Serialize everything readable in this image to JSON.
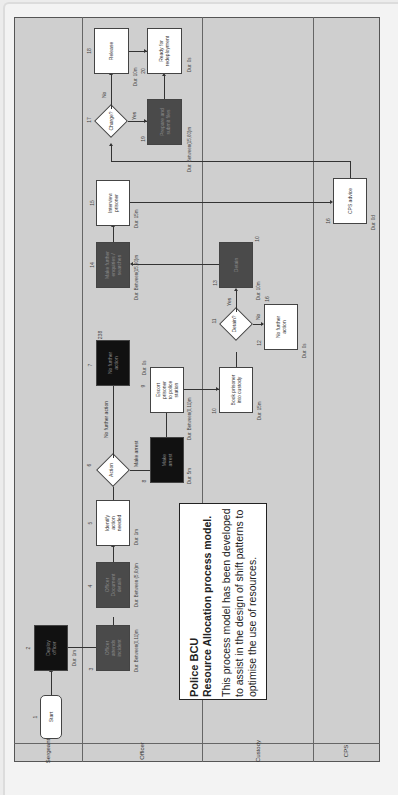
{
  "info_box": {
    "title": "Police BCU",
    "subtitle": "Resource Allocation process model.",
    "body": "This process model has been developed to assist in the design of shift patterns to optimise the use of resources."
  },
  "lanes": [
    {
      "name": "Sergeant"
    },
    {
      "name": "Officer"
    },
    {
      "name": "Custody"
    },
    {
      "name": "CPS"
    }
  ],
  "nodes": {
    "n1": {
      "id": "1",
      "label": "Start",
      "type": "start"
    },
    "n2": {
      "id": "2",
      "label": "Deploy\nofficer",
      "type": "task-black",
      "badge": "3",
      "duration": "Dur: 1m"
    },
    "n3": {
      "id": "3",
      "label": "Officer\nattends\nincident",
      "type": "task-dark",
      "badge": "35",
      "duration": "Dur: Between(0,11)m"
    },
    "n4": {
      "id": "4",
      "label": "Officer\nDocument\ndetails",
      "type": "task-dark",
      "badge": "100%",
      "duration": "Dur: Between\n(5,6x)m"
    },
    "n5": {
      "id": "5",
      "label": "Identify\naction\nneeded",
      "type": "task-white",
      "duration": "Dur: 1m"
    },
    "n6": {
      "id": "6",
      "label": "Action",
      "type": "decision"
    },
    "n7": {
      "id": "7",
      "label": "No further\naction",
      "type": "task-black",
      "badge": "238",
      "duration": "Dur: 0s"
    },
    "n8": {
      "id": "8",
      "label": "Make\narrest",
      "type": "task-black",
      "duration": "Dur: 5m"
    },
    "n9": {
      "id": "9",
      "label": "Escort\nprisoner\nto police\nstation",
      "type": "task-white",
      "duration": "Dur: Between(0,11)m"
    },
    "n10": {
      "id": "10",
      "label": "Book prisoner\ninto custody",
      "type": "task-white",
      "duration": "Dur: 15m"
    },
    "n11": {
      "id": "11",
      "label": "Detain?",
      "type": "decision"
    },
    "n12": {
      "id": "12",
      "label": "No further\naction",
      "type": "task-white",
      "duration": "Dur: 0s"
    },
    "n13": {
      "id": "13",
      "label": "Detain",
      "type": "task-dark",
      "badge": "10",
      "duration": "Dur: 10m",
      "extra": "16"
    },
    "n14": {
      "id": "14",
      "label": "Make further\nenquiries /\nsearches",
      "type": "task-dark",
      "badge": "17",
      "duration": "Dur: Between(15,30)m"
    },
    "n15": {
      "id": "15",
      "label": "Interview\nprisoner",
      "type": "task-white",
      "duration": "Dur: 15m"
    },
    "n16": {
      "id": "16",
      "label": "CPS advice",
      "type": "task-white",
      "duration": "Dur: 0d"
    },
    "n17": {
      "id": "17",
      "label": "Charge?",
      "type": "decision"
    },
    "n18": {
      "id": "18",
      "label": "Release",
      "type": "task-white",
      "duration": "Dur: 10m"
    },
    "n19": {
      "id": "19",
      "label": "Prepare and\nsubmit files",
      "type": "task-dark",
      "duration": "Dur: Between(15,60)m"
    },
    "n20": {
      "id": "20",
      "label": "Ready for\nredeployment",
      "type": "task-white",
      "duration": "Dur: 0s"
    }
  },
  "edge_labels": {
    "no_further_action": "No further action",
    "make_arrest": "Make arrest",
    "yes_11": "Yes",
    "no_11": "No",
    "yes_17": "Yes",
    "no_17": "No"
  }
}
